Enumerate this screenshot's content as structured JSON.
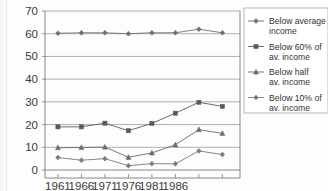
{
  "chart_data": {
    "type": "line",
    "title": "",
    "xlabel": "",
    "ylabel": "",
    "ylim": [
      0,
      70
    ],
    "ytick_values": [
      0,
      10,
      20,
      30,
      40,
      50,
      60,
      70
    ],
    "ytick_labels": [
      "0",
      "10",
      "20",
      "30",
      "40",
      "50",
      "60",
      "70"
    ],
    "grid": true,
    "legend_position": "right",
    "categories": [
      "1961",
      "1966",
      "1971",
      "1976",
      "1981",
      "1986",
      "",
      ""
    ],
    "xtick_labels": [
      "1961",
      "1966",
      "1971",
      "1976",
      "1981",
      "1986",
      "",
      ""
    ],
    "series": [
      {
        "name": "Below average income",
        "marker": "diamond",
        "color": "#6e6e6e",
        "values": [
          60.2,
          60.4,
          60.4,
          60.0,
          60.4,
          60.4,
          62.0,
          60.4
        ]
      },
      {
        "name": "Below 60% of av. income",
        "marker": "square",
        "color": "#5a5a5a",
        "values": [
          19.0,
          19.0,
          20.6,
          17.3,
          20.5,
          25.0,
          29.8,
          28.0
        ]
      },
      {
        "name": "Below half av. income",
        "marker": "triangle",
        "color": "#6a6a6a",
        "values": [
          9.8,
          9.9,
          10.1,
          5.6,
          7.5,
          11.1,
          17.8,
          16.1
        ]
      },
      {
        "name": "Below 10% of av. income",
        "marker": "diamond",
        "color": "#7a7a7a",
        "values": [
          5.5,
          4.3,
          5.0,
          1.9,
          2.8,
          2.7,
          8.4,
          6.8
        ]
      }
    ]
  },
  "legend": {
    "entries": [
      {
        "label_line1": "Below average",
        "label_line2": "income"
      },
      {
        "label_line1": "Below 60% of",
        "label_line2": "av. income"
      },
      {
        "label_line1": "Below half",
        "label_line2": "av. income"
      },
      {
        "label_line1": "Below 10% of",
        "label_line2": "av. income"
      }
    ]
  },
  "colors": {
    "gridline": "#8c8c8c",
    "axis": "#7a7a7a",
    "text": "#333333",
    "background": "#fdfdfd"
  }
}
